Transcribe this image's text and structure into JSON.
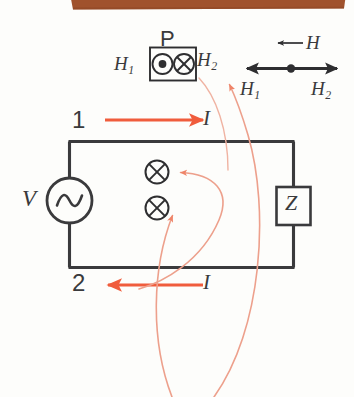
{
  "figure": {
    "background_color": "#fdfdfb",
    "wire_color": "#3a3a3c",
    "accent_color": "#f05c3c",
    "faint_accent_color": "#e8a494",
    "top_bar_color": "#a0522d",
    "probe": {
      "box_label": "P",
      "left_field_label": "H",
      "left_field_sub": "1",
      "right_field_label": "H",
      "right_field_sub": "2",
      "left_symbol": "dot-in-circle-icon",
      "right_symbol": "cross-in-circle-icon"
    },
    "legend": {
      "field_label": "H",
      "field_direction_icon": "left-arrow-icon",
      "left_label": "H",
      "left_sub": "1",
      "right_label": "H",
      "right_sub": "2",
      "axis_icon": "double-headed-arrow-icon",
      "center_icon": "origin-dot-icon"
    },
    "circuit": {
      "node_top_label": "1",
      "node_bottom_label": "2",
      "current_top_label": "I",
      "current_bottom_label": "I",
      "current_top_direction_icon": "right-arrow-icon",
      "current_bottom_direction_icon": "left-arrow-icon",
      "source_label": "V",
      "source_icon": "ac-source-icon",
      "load_label": "Z",
      "load_icon": "impedance-box-icon",
      "flux_symbol_upper": "cross-in-circle-icon",
      "flux_symbol_lower": "cross-in-circle-icon"
    }
  }
}
